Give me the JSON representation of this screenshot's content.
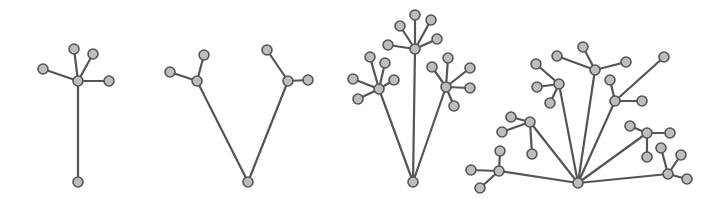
{
  "style": {
    "node_fill": "#bdbdbd",
    "node_stroke": "#555555",
    "edge_color": "#555555",
    "node_radius": 5
  },
  "trees": [
    {
      "name": "tree-1",
      "root": [
        78,
        182
      ],
      "hubs": [
        {
          "at": [
            78,
            81
          ],
          "children": [
            [
              74,
              49
            ],
            [
              93,
              54
            ],
            [
              43,
              69
            ],
            [
              109,
              81
            ]
          ]
        }
      ]
    },
    {
      "name": "tree-2",
      "root": [
        248,
        182
      ],
      "hubs": [
        {
          "at": [
            197,
            81
          ],
          "children": [
            [
              170,
              72
            ],
            [
              204,
              55
            ]
          ]
        },
        {
          "at": [
            288,
            81
          ],
          "children": [
            [
              267,
              50
            ],
            [
              308,
              80
            ]
          ]
        }
      ]
    },
    {
      "name": "tree-3",
      "root": [
        413,
        182
      ],
      "hubs": [
        {
          "at": [
            379,
            89
          ],
          "children": [
            [
              370,
              57
            ],
            [
              385,
              63
            ],
            [
              353,
              79
            ],
            [
              394,
              80
            ],
            [
              358,
              99
            ]
          ]
        },
        {
          "at": [
            415,
            49
          ],
          "children": [
            [
              415,
              15
            ],
            [
              400,
              26
            ],
            [
              431,
              20
            ],
            [
              437,
              39
            ],
            [
              388,
              45
            ]
          ]
        },
        {
          "at": [
            446,
            87
          ],
          "children": [
            [
              432,
              67
            ],
            [
              448,
              58
            ],
            [
              470,
              68
            ],
            [
              470,
              88
            ],
            [
              454,
              106
            ]
          ]
        }
      ]
    },
    {
      "name": "tree-4",
      "root": [
        578,
        183
      ],
      "hubs": [
        {
          "at": [
            499,
            171
          ],
          "children": [
            [
              471,
              170
            ],
            [
              500,
              151
            ],
            [
              480,
              188
            ]
          ]
        },
        {
          "at": [
            530,
            122
          ],
          "children": [
            [
              511,
              117
            ],
            [
              502,
              132
            ],
            [
              532,
              154
            ]
          ]
        },
        {
          "at": [
            559,
            84
          ],
          "children": [
            [
              536,
              64
            ],
            [
              537,
              87
            ],
            [
              550,
              103
            ]
          ]
        },
        {
          "at": [
            595,
            70
          ],
          "children": [
            [
              583,
              47
            ],
            [
              557,
              56
            ],
            [
              626,
              62
            ]
          ]
        },
        {
          "at": [
            615,
            101
          ],
          "children": [
            [
              610,
              80
            ],
            [
              642,
              101
            ],
            [
              664,
              57
            ]
          ]
        },
        {
          "at": [
            647,
            133
          ],
          "children": [
            [
              630,
              126
            ],
            [
              670,
              133
            ],
            [
              647,
              157
            ]
          ]
        },
        {
          "at": [
            668,
            174
          ],
          "children": [
            [
              661,
              148
            ],
            [
              681,
              155
            ],
            [
              687,
              179
            ]
          ]
        }
      ]
    }
  ]
}
